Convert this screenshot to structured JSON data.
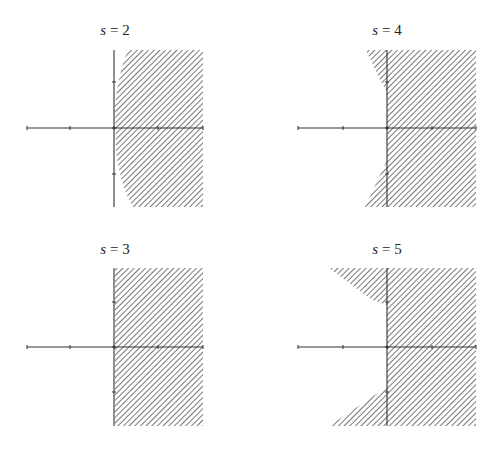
{
  "figure": {
    "panels": [
      {
        "id": "s2",
        "title_var": "s",
        "title_eq": " = 2",
        "title_x": 115,
        "title_y": 22,
        "origin": [
          114,
          128
        ],
        "xaxis": [
          27,
          203
        ],
        "yaxis": [
          50,
          207
        ],
        "xticks": [
          27,
          70,
          114,
          158,
          203
        ],
        "yticks": [
          82,
          128,
          174
        ],
        "region": "M128,50 L203,50 L203,207 L133,207 Q120,185 116,150 L115,106 Q119,70 128,50 Z"
      },
      {
        "id": "s4",
        "title_var": "s",
        "title_eq": " = 4",
        "title_x": 387,
        "title_y": 22,
        "origin": [
          387,
          128
        ],
        "xaxis": [
          298,
          476
        ],
        "yaxis": [
          50,
          207
        ],
        "xticks": [
          298,
          343,
          387,
          432,
          476
        ],
        "yticks": [
          82,
          128,
          174
        ],
        "region": "M366,50 L476,50 L476,207 L365,207 L380,175 L387,160 L387,92 L380,80 Z"
      },
      {
        "id": "s3",
        "title_var": "s",
        "title_eq": " = 3",
        "title_x": 115,
        "title_y": 241,
        "origin": [
          114,
          347
        ],
        "xaxis": [
          27,
          203
        ],
        "yaxis": [
          268,
          426
        ],
        "xticks": [
          27,
          70,
          114,
          158,
          203
        ],
        "yticks": [
          302,
          347,
          392
        ],
        "region": "M115,268 L203,268 L203,426 L115,426 Z"
      },
      {
        "id": "s5",
        "title_var": "s",
        "title_eq": " = 5",
        "title_x": 387,
        "title_y": 241,
        "origin": [
          387,
          347
        ],
        "xaxis": [
          298,
          476
        ],
        "yaxis": [
          268,
          426
        ],
        "xticks": [
          298,
          343,
          387,
          432,
          476
        ],
        "yticks": [
          302,
          347,
          392
        ],
        "region": "M329,268 L476,268 L476,426 L329,426 L375,395 L387,388 L387,305 L372,300 Z"
      }
    ],
    "hatch_color": "#555555",
    "axis_color": "#333333"
  }
}
